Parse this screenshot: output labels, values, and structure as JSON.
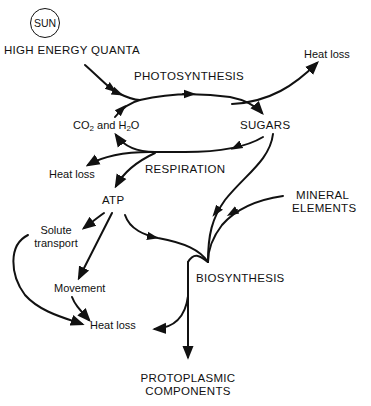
{
  "diagram": {
    "nodes": {
      "sun": "SUN",
      "high_energy_quanta": "HIGH ENERGY  QUANTA",
      "photosynthesis": "PHOTOSYNTHESIS",
      "heat_loss_top": "Heat loss",
      "co2_prefix": "CO",
      "co2_sub": "2",
      "co2_and": " and H",
      "h2o_sub": "2",
      "h2o_suffix": "O",
      "sugars": "SUGARS",
      "heat_loss_respiration": "Heat loss",
      "respiration": "RESPIRATION",
      "atp": "ATP",
      "mineral_line1": "MINERAL",
      "mineral_line2": "ELEMENTS",
      "solute_line1": "Solute",
      "solute_line2": "transport",
      "biosynthesis": "BIOSYNTHESIS",
      "movement": "Movement",
      "heat_loss_bottom": "Heat loss",
      "protoplasmic_line1": "PROTOPLASMIC",
      "protoplasmic_line2": "COMPONENTS"
    },
    "edges": [
      {
        "from": "High energy quanta",
        "to": "Photosynthesis"
      },
      {
        "from": "CO2 and H2O",
        "to": "Photosynthesis"
      },
      {
        "from": "Photosynthesis",
        "to": "Sugars"
      },
      {
        "from": "Photosynthesis",
        "to": "Heat loss"
      },
      {
        "from": "Sugars",
        "to": "Respiration"
      },
      {
        "from": "Respiration",
        "to": "CO2 and H2O"
      },
      {
        "from": "Respiration",
        "to": "Heat loss"
      },
      {
        "from": "Respiration",
        "to": "ATP"
      },
      {
        "from": "Sugars",
        "to": "Biosynthesis"
      },
      {
        "from": "Mineral elements",
        "to": "Biosynthesis"
      },
      {
        "from": "ATP",
        "to": "Biosynthesis"
      },
      {
        "from": "ATP",
        "to": "Solute transport"
      },
      {
        "from": "ATP",
        "to": "Movement"
      },
      {
        "from": "Solute transport",
        "to": "Heat loss"
      },
      {
        "from": "Movement",
        "to": "Heat loss"
      },
      {
        "from": "Biosynthesis",
        "to": "Heat loss"
      },
      {
        "from": "Biosynthesis",
        "to": "Protoplasmic components"
      }
    ]
  }
}
